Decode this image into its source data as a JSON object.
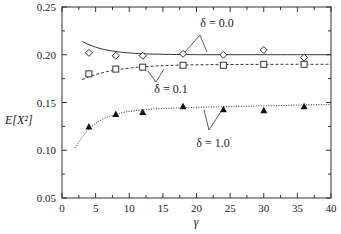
{
  "chart_data": {
    "type": "scatter",
    "title": "",
    "xlabel": "γ",
    "ylabel": "E[X²]",
    "xlim": [
      0,
      40
    ],
    "ylim": [
      0.05,
      0.25
    ],
    "x_ticks": [
      "0",
      "5",
      "10",
      "15",
      "20",
      "25",
      "30",
      "35",
      "40"
    ],
    "y_ticks": [
      "0.05",
      "0.10",
      "0.15",
      "0.20",
      "0.25"
    ],
    "grid": false,
    "legend": "inline annotations",
    "x": [
      4,
      8,
      12,
      18,
      24,
      30,
      36
    ],
    "series": [
      {
        "name": "δ = 0.0",
        "marker": "diamond-open",
        "values": [
          0.202,
          0.199,
          0.199,
          0.201,
          0.2,
          0.205,
          0.197
        ],
        "curve": "solid"
      },
      {
        "name": "δ = 0.1",
        "marker": "square-open",
        "values": [
          0.18,
          0.185,
          0.187,
          0.189,
          0.189,
          0.19,
          0.19
        ],
        "curve": "dashed"
      },
      {
        "name": "δ = 1.0",
        "marker": "triangle-filled",
        "values": [
          0.125,
          0.138,
          0.14,
          0.146,
          0.143,
          0.142,
          0.146
        ],
        "curve": "dotted"
      }
    ],
    "annotations": [
      "δ = 0.0",
      "δ = 0.1",
      "δ = 1.0"
    ]
  }
}
